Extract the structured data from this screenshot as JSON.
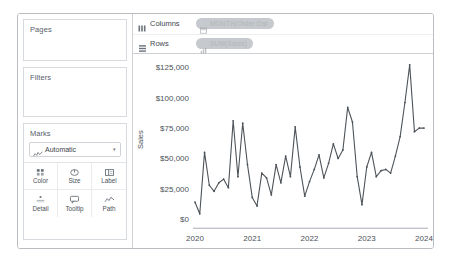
{
  "left_panel": {
    "pages": {
      "title": "Pages"
    },
    "filters": {
      "title": "Filters"
    },
    "marks": {
      "title": "Marks",
      "mark_type": {
        "label": "Automatic",
        "icon": "line-chart-icon",
        "caret": "▾"
      },
      "buttons": [
        {
          "label": "Color",
          "icon": "color-icon"
        },
        {
          "label": "Size",
          "icon": "size-icon"
        },
        {
          "label": "Label",
          "icon": "label-icon"
        },
        {
          "label": "Detail",
          "icon": "detail-icon"
        },
        {
          "label": "Tooltip",
          "icon": "tooltip-icon"
        },
        {
          "label": "Path",
          "icon": "path-icon"
        }
      ]
    }
  },
  "shelves": [
    {
      "name": "Columns",
      "icon": "columns-shelf-icon",
      "pill": {
        "text": "MONTH(Order Dat",
        "icon": "calendar-icon"
      }
    },
    {
      "name": "Rows",
      "icon": "rows-shelf-icon",
      "pill": {
        "text": "SUM(Sales)",
        "icon": "measure-icon"
      }
    }
  ],
  "chart_data": {
    "type": "line",
    "title": "",
    "xlabel": "",
    "ylabel": "Sales",
    "ylim": [
      0,
      131000
    ],
    "yticks": [
      0,
      25000,
      50000,
      75000,
      100000,
      125000
    ],
    "ytick_labels": [
      "$0",
      "$25,000",
      "$50,000",
      "$75,000",
      "$100,000",
      "$125,000"
    ],
    "xtick_labels": [
      "2020",
      "2021",
      "2022",
      "2023",
      "2024"
    ],
    "xticks": [
      0,
      12,
      24,
      36,
      48
    ],
    "grid": false,
    "legend": false,
    "line_color": "#4d5358",
    "series": [
      {
        "name": "SUM(Sales)",
        "x": [
          0,
          1,
          2,
          3,
          4,
          5,
          6,
          7,
          8,
          9,
          10,
          11,
          12,
          13,
          14,
          15,
          16,
          17,
          18,
          19,
          20,
          21,
          22,
          23,
          24,
          25,
          26,
          27,
          28,
          29,
          30,
          31,
          32,
          33,
          34,
          35,
          36,
          37,
          38,
          39,
          40,
          41,
          42,
          43,
          44,
          45,
          46,
          47,
          48
        ],
        "values": [
          14000,
          4500,
          55000,
          28000,
          23000,
          30000,
          33000,
          26000,
          81000,
          35000,
          79000,
          45000,
          18000,
          11000,
          38000,
          34000,
          20000,
          45000,
          30000,
          52000,
          35000,
          76000,
          43000,
          19000,
          31000,
          41000,
          53000,
          34000,
          46000,
          62000,
          50000,
          57000,
          92000,
          80000,
          35000,
          12000,
          43000,
          55000,
          35000,
          40000,
          41000,
          38000,
          52000,
          68000,
          96000,
          127000,
          72000,
          75000,
          75000
        ]
      }
    ]
  }
}
